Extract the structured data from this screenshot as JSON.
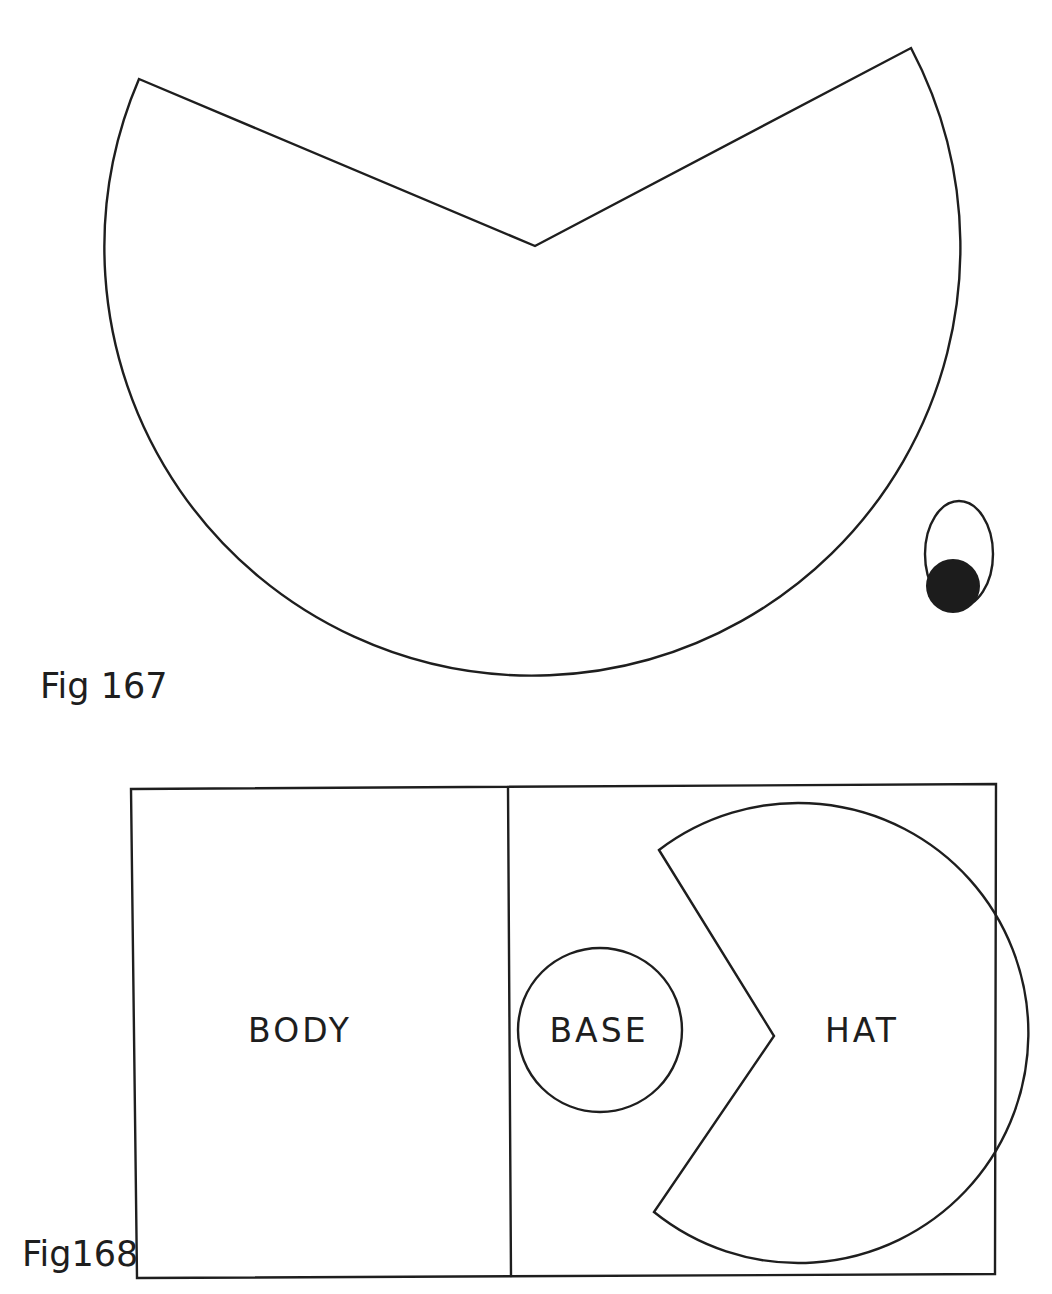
{
  "figures": [
    {
      "caption": "Fig 167",
      "description": "Cone pattern: circular sheet with V-shaped wedge cut out, plus a small eye piece (oval with dark pupil)",
      "parts": {
        "cone_pattern": "circle with wedge notch",
        "eye": "oval outline with filled pupil"
      }
    },
    {
      "caption": "Fig168",
      "description": "Layout sheet divided into two panels",
      "panels": [
        {
          "label": "BODY"
        },
        {
          "label": "BASE",
          "shape": "circle"
        },
        {
          "label": "HAT",
          "shape": "circle with wedge notch"
        }
      ]
    }
  ],
  "colors": {
    "ink": "#1e1e1e",
    "paper": "#ffffff"
  }
}
